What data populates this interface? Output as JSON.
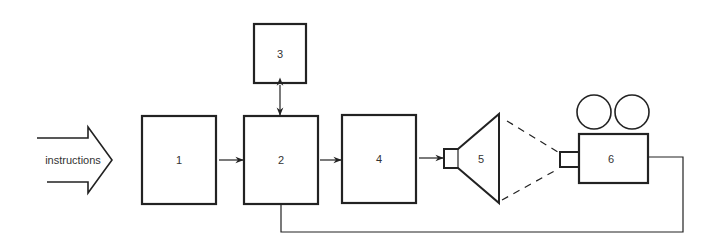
{
  "diagram": {
    "type": "block-diagram",
    "input": {
      "label": "instructions"
    },
    "blocks": [
      {
        "id": "1",
        "label": "1"
      },
      {
        "id": "2",
        "label": "2"
      },
      {
        "id": "3",
        "label": "3"
      },
      {
        "id": "4",
        "label": "4"
      },
      {
        "id": "5",
        "label": "5",
        "shape": "screen"
      },
      {
        "id": "6",
        "label": "6",
        "shape": "camera"
      }
    ],
    "edges": [
      {
        "from": "instructions",
        "to": "1",
        "style": "block-arrow"
      },
      {
        "from": "1",
        "to": "2",
        "style": "arrow"
      },
      {
        "from": "2",
        "to": "3",
        "style": "bidirectional-arrow"
      },
      {
        "from": "2",
        "to": "4",
        "style": "arrow"
      },
      {
        "from": "4",
        "to": "5",
        "style": "arrow"
      },
      {
        "from": "5",
        "to": "6",
        "style": "dashed-view-cone"
      },
      {
        "from": "6",
        "to": "2",
        "style": "feedback-line"
      }
    ],
    "colors": {
      "stroke": "#222222",
      "text": "#333333",
      "background": "#ffffff"
    }
  }
}
